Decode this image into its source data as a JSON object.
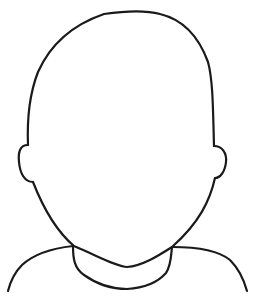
{
  "image": {
    "description": "Blank head and shoulders outline drawing",
    "stroke_color": "#1a1a1a",
    "background_color": "#ffffff",
    "parts": [
      "head",
      "left-ear",
      "right-ear",
      "neck-collar",
      "left-shoulder",
      "right-shoulder"
    ]
  }
}
